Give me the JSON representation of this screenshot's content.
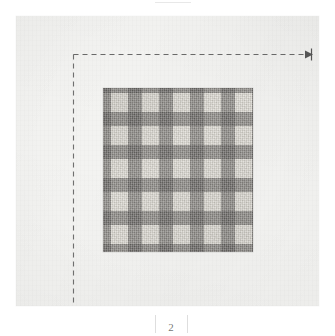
{
  "document": {
    "kind": "scanned-book-page",
    "page_number": "2",
    "background_color": "#ffffff",
    "page_color": "#f3f3f1"
  },
  "figure": {
    "caption": "",
    "swatch": {
      "name": "gingham-check-fabric-swatch",
      "pattern": "gingham",
      "columns": 5,
      "rows": 5,
      "colors": {
        "light_square": "#dedbd4",
        "mid_band": "#8e8b86",
        "dark_crossing": "#56534f"
      }
    }
  },
  "annotations": {
    "vertical_guide": {
      "name": "vertical-dashed-guide",
      "style": "dashed",
      "color": "#4a4a4a"
    },
    "horizontal_guide": {
      "name": "horizontal-dashed-guide",
      "style": "dashed",
      "color": "#4a4a4a",
      "arrowhead": "right"
    }
  },
  "footer": {
    "page_number": "2",
    "rules_visible": true
  }
}
